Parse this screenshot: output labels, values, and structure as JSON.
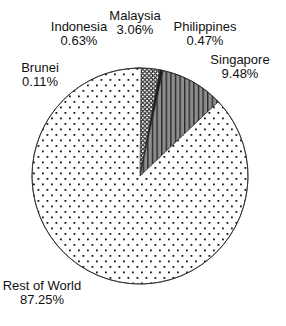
{
  "chart_data": {
    "type": "pie",
    "title": "",
    "unit": "percent",
    "direction": "clockwise",
    "start_angle_deg": -3,
    "slices": [
      {
        "label": "Brunei",
        "value": 0.11,
        "display": "0.11%",
        "pattern": "white"
      },
      {
        "label": "Indonesia",
        "value": 0.63,
        "display": "0.63%",
        "pattern": "hstripes"
      },
      {
        "label": "Malaysia",
        "value": 3.06,
        "display": "3.06%",
        "pattern": "mesh"
      },
      {
        "label": "Philippines",
        "value": 0.47,
        "display": "0.47%",
        "pattern": "solid_dark"
      },
      {
        "label": "Singapore",
        "value": 9.48,
        "display": "9.48%",
        "pattern": "vstripes_gray"
      },
      {
        "label": "Rest of World",
        "value": 87.25,
        "display": "87.25%",
        "pattern": "dots"
      }
    ],
    "colors": {
      "background": "#ffffff",
      "outline": "#2b2b2b",
      "singapore_gray": "#8d8d8d",
      "ink": "#161616"
    },
    "legend": "none",
    "labels_placement": "outside-floating"
  }
}
